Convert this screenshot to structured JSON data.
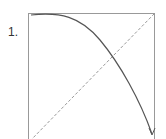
{
  "figure": {
    "label": "1.",
    "colors": {
      "frame": "#999999",
      "curve": "#555555",
      "diagonal": "#999999"
    }
  }
}
